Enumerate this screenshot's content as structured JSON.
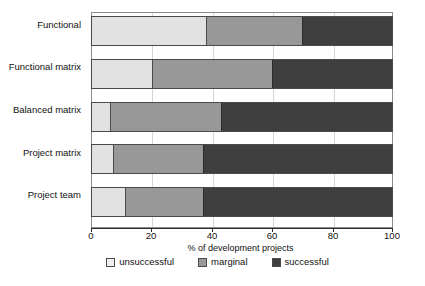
{
  "chart_data": {
    "type": "bar",
    "orientation": "horizontal",
    "stacked": true,
    "stacked_mode": "percent",
    "title": "",
    "xlabel": "% of development projects",
    "ylabel": "",
    "xlim": [
      0,
      100
    ],
    "xticks": [
      "0",
      "20",
      "40",
      "60",
      "80",
      "100"
    ],
    "xtick_values": [
      0,
      20,
      40,
      60,
      80,
      100
    ],
    "grid": true,
    "grid_axis": "x",
    "legend_position": "bottom",
    "categories": [
      "Functional",
      "Functional matrix",
      "Balanced matrix",
      "Project matrix",
      "Project team"
    ],
    "series": [
      {
        "name": "unsuccessful",
        "color": "#e2e2e2",
        "values": [
          38,
          20,
          6,
          7,
          11
        ]
      },
      {
        "name": "marginal",
        "color": "#989898",
        "values": [
          32,
          40,
          37,
          30,
          26
        ]
      },
      {
        "name": "successful",
        "color": "#3f3f3f",
        "values": [
          30,
          40,
          57,
          63,
          63
        ]
      }
    ]
  },
  "legend": {
    "items": [
      {
        "label": "unsuccessful"
      },
      {
        "label": "marginal"
      },
      {
        "label": "successful"
      }
    ]
  }
}
